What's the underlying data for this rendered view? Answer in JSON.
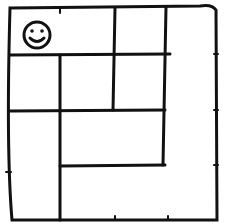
{
  "diagram": {
    "type": "hand-drawn maze grid",
    "stroke_color": "#111111",
    "background": "#ffffff",
    "start_marker": {
      "icon": "smiley-face-icon",
      "cell": "top-left"
    },
    "outer_border": {
      "left": 10,
      "top": 8,
      "right": 217,
      "bottom": 220
    },
    "walls": [
      {
        "from": [
          10,
          55
        ],
        "to": [
          170,
          55
        ]
      },
      {
        "from": [
          115,
          8
        ],
        "to": [
          113,
          110
        ]
      },
      {
        "from": [
          165,
          8
        ],
        "to": [
          163,
          165
        ]
      },
      {
        "from": [
          60,
          55
        ],
        "to": [
          60,
          220
        ]
      },
      {
        "from": [
          10,
          110
        ],
        "to": [
          165,
          110
        ]
      },
      {
        "from": [
          60,
          165
        ],
        "to": [
          165,
          165
        ]
      }
    ]
  }
}
